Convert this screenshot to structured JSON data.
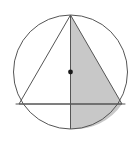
{
  "figure": {
    "kind": "geometry-diagram",
    "canvas": {
      "width": 137,
      "height": 142,
      "background": "#ffffff"
    },
    "colors": {
      "stroke": "#555555",
      "shade_fill": "#c8c8c8",
      "unshaded_fill": "#ffffff",
      "center_dot": "#1a1a1a"
    },
    "stroke_width": 1,
    "circle": {
      "name": "circumscribed-circle",
      "cx": 70.5,
      "cy": 72,
      "r": 57,
      "left_x": 13.5,
      "right_x": 127.5,
      "top_y": 15,
      "bottom_y": 129
    },
    "center_point": {
      "name": "circle-center-dot",
      "cx": 70.5,
      "cy": 72,
      "r": 2.4
    },
    "triangle": {
      "name": "inscribed-triangle",
      "apex": {
        "x": 70.5,
        "y": 15
      },
      "left_base": {
        "x": 19,
        "y": 104
      },
      "right_base": {
        "x": 122,
        "y": 104
      },
      "points": "70.5,15 19,104 122,104"
    },
    "horizontal_chord": {
      "name": "horizontal-chord",
      "x1": 15.6,
      "y1": 104,
      "x2": 125.4,
      "y2": 104
    },
    "vertical_diameter": {
      "name": "vertical-diameter",
      "x1": 70.5,
      "y1": 15,
      "x2": 70.5,
      "y2": 129
    },
    "shaded_regions": [
      {
        "name": "shaded-right-half-triangle",
        "description": "right half of the inscribed triangle between the vertical diameter and the right slanted side",
        "points": "70.5,15 122,104 70.5,104"
      },
      {
        "name": "shaded-lower-right-segment",
        "description": "circular segment below the horizontal chord on the right of the vertical diameter",
        "path": "M 70.5 104 L 122 104 A 57 57 0 0 1 70.5 129 Z"
      }
    ]
  }
}
